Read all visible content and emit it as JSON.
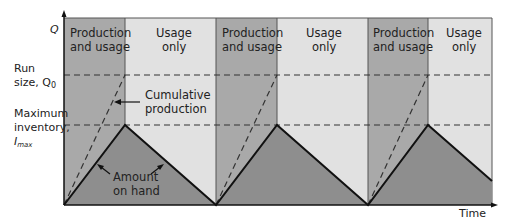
{
  "diagram": {
    "axes": {
      "y_label": "Q",
      "x_label": "Time",
      "y_ticks": [
        {
          "line1": "Run",
          "line2": "size, Q",
          "sub": "0",
          "name": "run-size"
        },
        {
          "line1": "Maximum",
          "line2": "inventory,",
          "line3": "I",
          "sub": "max",
          "name": "maximum-inventory"
        }
      ]
    },
    "phases": [
      {
        "label_line1": "Production",
        "label_line2": "and usage"
      },
      {
        "label_line1": "Usage",
        "label_line2": "only"
      },
      {
        "label_line1": "Production",
        "label_line2": "and usage"
      },
      {
        "label_line1": "Usage",
        "label_line2": "only"
      },
      {
        "label_line1": "Production",
        "label_line2": "and usage"
      },
      {
        "label_line1": "Usage",
        "label_line2": "only"
      }
    ],
    "annotations": {
      "cumulative_line1": "Cumulative",
      "cumulative_line2": "production",
      "amount_line1": "Amount",
      "amount_line2": "on hand"
    },
    "colors": {
      "production_bg": "#a9a9a9",
      "usage_bg": "#e1e1e1",
      "on_hand_fill": "#8e8e8e",
      "line": "#111111"
    },
    "cycles": 3
  }
}
